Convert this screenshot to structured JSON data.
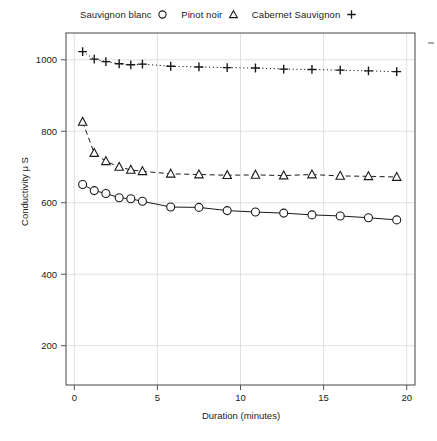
{
  "chart_data": {
    "type": "scatter",
    "title": "",
    "xlabel": "Duration (minutes)",
    "ylabel": "Conductivity μ S",
    "xlim": [
      -0.5,
      20.5
    ],
    "ylim": [
      90,
      1075
    ],
    "xticks": [
      0,
      5,
      10,
      15,
      20
    ],
    "yticks": [
      200,
      400,
      600,
      800,
      1000
    ],
    "xtick_labels": [
      "0",
      "5",
      "10",
      "15",
      "20"
    ],
    "ytick_labels": [
      "200",
      "400",
      "600",
      "800",
      "1000"
    ],
    "grid": true,
    "legend_position": "top",
    "series": [
      {
        "name": "Sauvignon blanc",
        "marker": "circle",
        "line_style": "solid",
        "color": "#1a1a1a",
        "x": [
          0.5,
          1.2,
          1.9,
          2.7,
          3.4,
          4.1,
          5.8,
          7.5,
          9.2,
          10.9,
          12.6,
          14.3,
          16.0,
          17.7,
          19.4
        ],
        "y": [
          651,
          634,
          626,
          614,
          611,
          604,
          588,
          587,
          578,
          574,
          571,
          566,
          563,
          558,
          552
        ]
      },
      {
        "name": "Pinot noir",
        "marker": "triangle",
        "line_style": "dashed",
        "color": "#1a1a1a",
        "x": [
          0.5,
          1.2,
          1.9,
          2.7,
          3.4,
          4.1,
          5.8,
          7.5,
          9.2,
          10.9,
          12.6,
          14.3,
          16.0,
          17.7,
          19.4
        ],
        "y": [
          826,
          739,
          716,
          700,
          692,
          688,
          681,
          679,
          677,
          678,
          676,
          679,
          675,
          674,
          672
        ]
      },
      {
        "name": "Cabernet Sauvignon",
        "marker": "plus",
        "line_style": "dotted",
        "color": "#1a1a1a",
        "x": [
          0.5,
          1.2,
          1.9,
          2.7,
          3.4,
          4.1,
          5.8,
          7.5,
          9.2,
          10.9,
          12.6,
          14.3,
          16.0,
          17.7,
          19.4
        ],
        "y": [
          1023,
          1002,
          995,
          989,
          986,
          988,
          982,
          980,
          978,
          977,
          974,
          973,
          971,
          969,
          967
        ]
      }
    ]
  },
  "legend": {
    "entries": [
      {
        "label": "Sauvignon blanc",
        "marker": "circle"
      },
      {
        "label": "Pinot noir",
        "marker": "triangle"
      },
      {
        "label": "Cabernet Sauvignon",
        "marker": "plus"
      }
    ]
  },
  "colors": {
    "ink": "#1a1a1a",
    "axis": "#555555",
    "grid": "#d8d8d8",
    "background": "#ffffff"
  }
}
